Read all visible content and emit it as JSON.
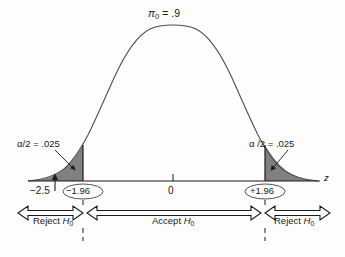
{
  "figure": {
    "axis_label": "z",
    "background_color": "#fdfdfd",
    "curve_color": "#4d4d4d",
    "tail_fill_color": "#808080",
    "text_color": "#1a1a1a"
  },
  "annotations": {
    "alpha_left": "α/2 = .025",
    "alpha_right": "α /2 = .025",
    "observed_value": "−2.5",
    "critical_left": "−1.96",
    "center_tick": "0",
    "critical_right": "+1.96"
  },
  "regions": {
    "reject_left": "Reject H₀",
    "accept": "Accept H₀",
    "reject_right": "Reject H₀"
  },
  "chart_data": {
    "type": "line",
    "xlabel": "z",
    "ylabel": "",
    "distribution": "standard normal sampling distribution",
    "xlim": [
      -4.2,
      4.2
    ],
    "ylim": [
      0,
      0.42
    ],
    "grid": false,
    "legend": null,
    "x_ticks": [
      -2.5,
      -1.96,
      0,
      1.96
    ],
    "x_tick_labels": [
      "−2.5",
      "−1.96",
      "0",
      "+1.96"
    ],
    "null_hypothesis_parameter": 0.9,
    "alpha_total": 0.05,
    "alpha_per_tail": 0.025,
    "critical_values": [
      -1.96,
      1.96
    ],
    "observed_test_statistic": -2.5,
    "decision": "Reject H₀",
    "shaded_regions": [
      {
        "name": "left rejection tail",
        "from": -4.2,
        "to": -1.96,
        "area": 0.025
      },
      {
        "name": "right rejection tail",
        "from": 1.96,
        "to": 4.2,
        "area": 0.025
      }
    ],
    "decision_bands": [
      {
        "label": "Reject H₀",
        "from": -4.2,
        "to": -1.96
      },
      {
        "label": "Accept H₀",
        "from": -1.96,
        "to": 1.96
      },
      {
        "label": "Reject H₀",
        "from": 1.96,
        "to": 4.2
      }
    ],
    "series": [
      {
        "name": "normal density",
        "x": [
          -4.2,
          -3.8,
          -3.4,
          -3.0,
          -2.6,
          -2.2,
          -1.96,
          -1.8,
          -1.4,
          -1.0,
          -0.6,
          -0.2,
          0,
          0.2,
          0.6,
          1.0,
          1.4,
          1.8,
          1.96,
          2.2,
          2.6,
          3.0,
          3.4,
          3.8,
          4.2
        ],
        "y": [
          0.0001,
          0.0003,
          0.0012,
          0.0044,
          0.0136,
          0.0355,
          0.0584,
          0.079,
          0.1497,
          0.242,
          0.3332,
          0.391,
          0.3989,
          0.391,
          0.3332,
          0.242,
          0.1497,
          0.079,
          0.0584,
          0.0355,
          0.0136,
          0.0044,
          0.0012,
          0.0003,
          0.0001
        ]
      }
    ]
  }
}
